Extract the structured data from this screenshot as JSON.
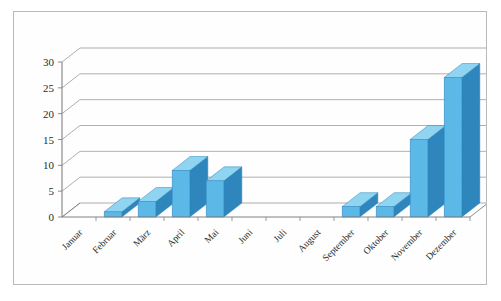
{
  "chart_data": {
    "type": "bar",
    "title": "",
    "subtitle": "",
    "xlabel": "",
    "ylabel": "",
    "categories": [
      "Januar",
      "Februar",
      "März",
      "April",
      "Mai",
      "Juni",
      "Juli",
      "August",
      "September",
      "Oktober",
      "November",
      "Dezember"
    ],
    "values": [
      0,
      1,
      3,
      9,
      7,
      0,
      0,
      0,
      2,
      2,
      15,
      27
    ],
    "series": [
      {
        "name": "",
        "values": [
          0,
          1,
          3,
          9,
          7,
          0,
          0,
          0,
          2,
          2,
          15,
          27
        ]
      }
    ],
    "ylim": [
      0,
      30
    ],
    "ytick_values": [
      0,
      5,
      10,
      15,
      20,
      25,
      30
    ],
    "ytick_labels": [
      "0",
      "5",
      "10",
      "15",
      "20",
      "25",
      "30"
    ],
    "grid": true,
    "grid_axis": "y",
    "legend": false,
    "legend_position": "none",
    "three_d": true,
    "xtick_rotation": 45,
    "annotations": []
  },
  "style": {
    "bar_front_color": "#5cb8e6",
    "bar_top_color": "#8fd4f0",
    "bar_side_color": "#2f86bd",
    "bar_edge_color": "#2f86bd",
    "grid_color": "#9a9a9a",
    "axis_color": "#808080",
    "frame_border_color": "#b9b9b9",
    "plot_background": "#ffffff",
    "tick_text_color": "#2b2b2b"
  },
  "caption": {
    "cut_off_line": " "
  }
}
